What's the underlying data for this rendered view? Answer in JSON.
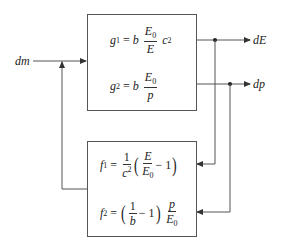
{
  "diagram": {
    "input_label": "dm",
    "outputs": [
      {
        "label": "dE"
      },
      {
        "label": "dp"
      }
    ],
    "top_block": {
      "g1": {
        "lhs": "g",
        "lhs_sub": "1",
        "eq": "=",
        "coef": "b",
        "num": "E",
        "num_sub": "0",
        "den": "E",
        "tail": "c",
        "tail_sup": "2"
      },
      "g2": {
        "lhs": "g",
        "lhs_sub": "2",
        "eq": "=",
        "coef": "b",
        "num": "E",
        "num_sub": "0",
        "den": "p"
      }
    },
    "bottom_block": {
      "f1": {
        "lhs": "f",
        "lhs_sub": "1",
        "eq": "=",
        "num1": "1",
        "den1": "c",
        "den1_sup": "2",
        "lparen": "(",
        "num2": "E",
        "den2": "E",
        "den2_sub": "0",
        "minus": "−",
        "one": "1",
        "rparen": ")"
      },
      "f2": {
        "lhs": "f",
        "lhs_sub": "2",
        "eq": "=",
        "lparen": "(",
        "num1": "1",
        "den1": "b",
        "minus": "−",
        "one": "1",
        "rparen": ")",
        "num2": "p",
        "den2": "E",
        "den2_sub": "0"
      }
    },
    "colors": {
      "line": "#555555",
      "text": "#222222"
    }
  }
}
